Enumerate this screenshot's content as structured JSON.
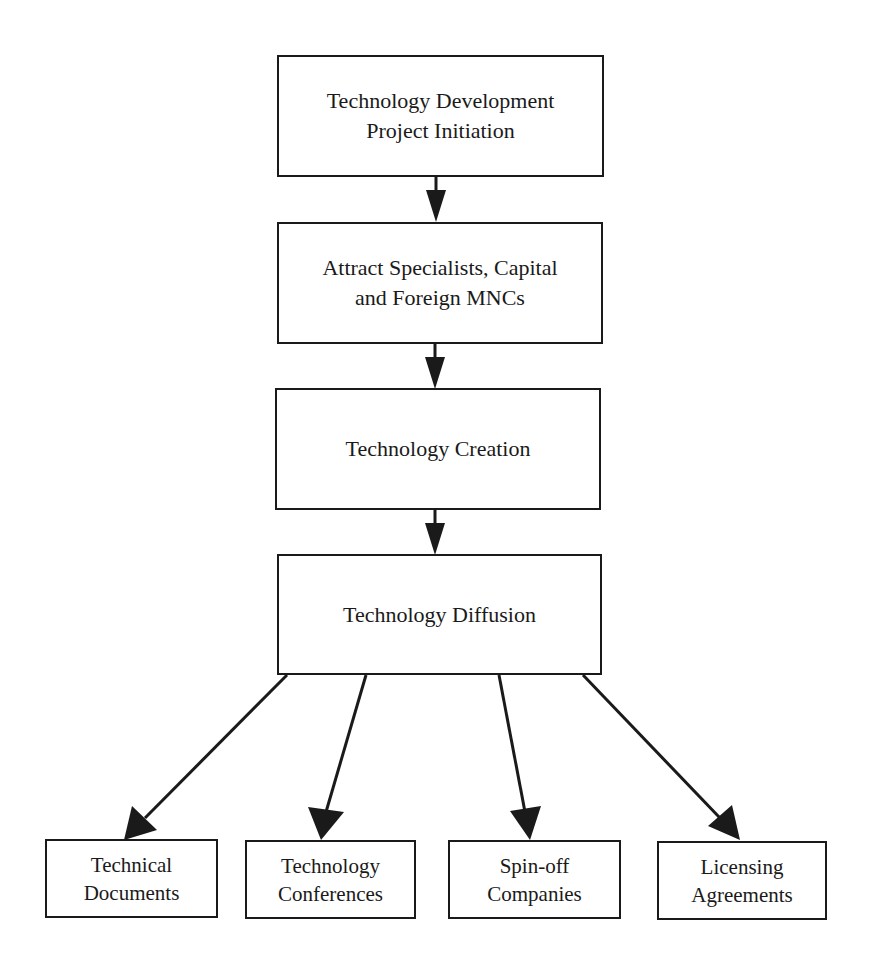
{
  "diagram": {
    "stages": [
      {
        "id": "initiation",
        "lines": [
          "Technology Development",
          "Project Initiation"
        ]
      },
      {
        "id": "attract",
        "lines": [
          "Attract Specialists, Capital",
          "and Foreign MNCs"
        ]
      },
      {
        "id": "creation",
        "lines": [
          "Technology Creation"
        ]
      },
      {
        "id": "diffusion",
        "lines": [
          "Technology Diffusion"
        ]
      }
    ],
    "outputs": [
      {
        "id": "technical-documents",
        "lines": [
          "Technical",
          "Documents"
        ]
      },
      {
        "id": "technology-conferences",
        "lines": [
          "Technology",
          "Conferences"
        ]
      },
      {
        "id": "spin-off-companies",
        "lines": [
          "Spin-off",
          "Companies"
        ]
      },
      {
        "id": "licensing-agreements",
        "lines": [
          "Licensing",
          "Agreements"
        ]
      }
    ],
    "edges": [
      {
        "from": "initiation",
        "to": "attract"
      },
      {
        "from": "attract",
        "to": "creation"
      },
      {
        "from": "creation",
        "to": "diffusion"
      },
      {
        "from": "diffusion",
        "to": "technical-documents"
      },
      {
        "from": "diffusion",
        "to": "technology-conferences"
      },
      {
        "from": "diffusion",
        "to": "spin-off-companies"
      },
      {
        "from": "diffusion",
        "to": "licensing-agreements"
      }
    ],
    "colors": {
      "stroke": "#1a1a1a",
      "background": "#ffffff"
    }
  }
}
